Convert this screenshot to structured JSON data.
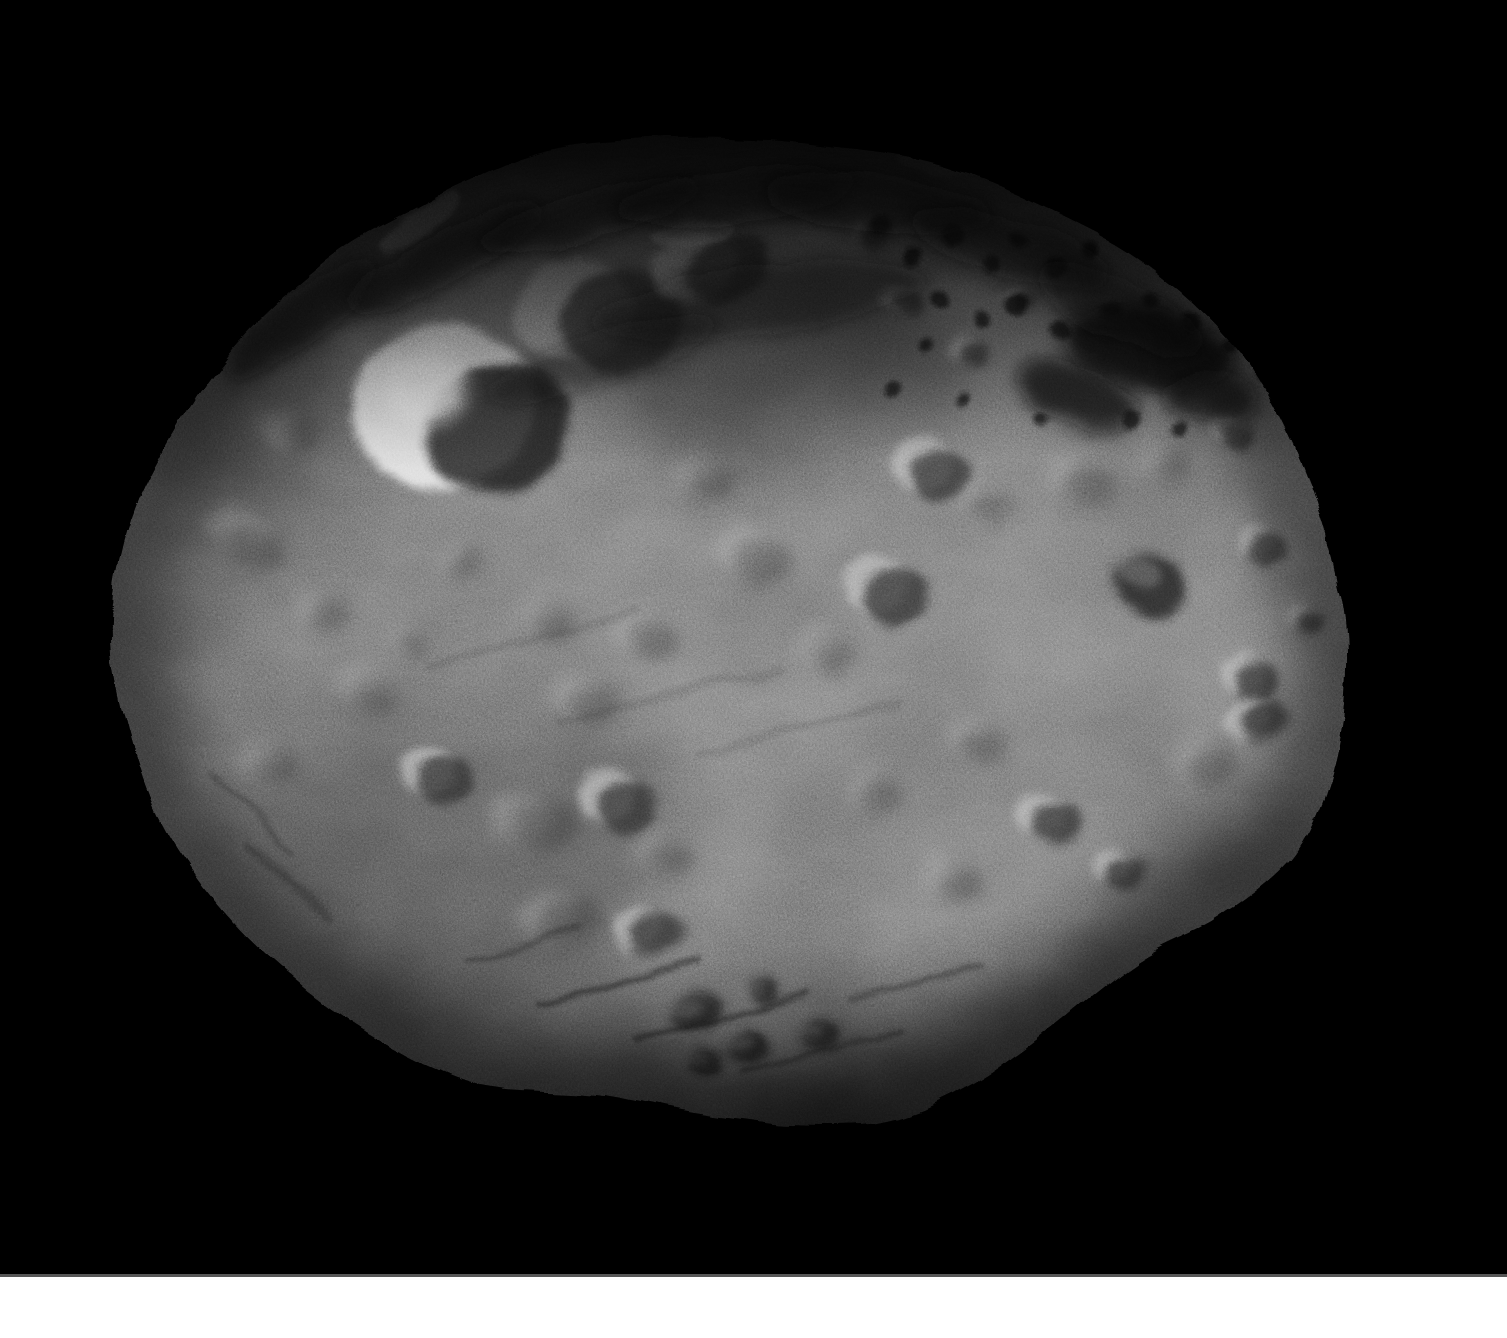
{
  "image": {
    "subject": "Full-disk grayscale photograph of asteroid Vesta against black space",
    "visible_text": "",
    "bottom_strip": "white strip across full width at bottom of frame"
  },
  "palette": {
    "space": "#000000",
    "bottom_strip": "#ffffff",
    "strip_edge": "#8f8f8f",
    "surface_core": "#9d9d9d",
    "surface_mid": "#8e8e8e",
    "surface_dim": "#7c7c7c",
    "surface_edge": "#6e6e6e",
    "crater_highlight": "#c6c6c6",
    "crater_shadow": "#2e2e2e",
    "bright_crater_fill": "#e6e6e6",
    "bright_hotspot": "#f2f2f2",
    "dark_bowl": "#1a1a1a",
    "north_shadow": "#000000",
    "streak_dark": "#0e0e0e",
    "speckle_dark": "#101010",
    "shade_dark": "#000000",
    "shade_light": "#d2d2d2",
    "groove_dark": "#222222",
    "bright_arc": "#dcdcdc"
  },
  "scene": {
    "canvas": {
      "width": 1507,
      "height": 1338,
      "strip_top": 1277,
      "strip_edge_height": 3
    },
    "body_box": {
      "x": 100,
      "y": 118,
      "width": 1260,
      "height": 1030
    },
    "top_shadow_rect": {
      "x": 90,
      "y": 118,
      "width": 1320,
      "height": 345
    },
    "bottom_shadow_rect": {
      "x": 140,
      "y": 915,
      "width": 1270,
      "height": 230
    },
    "outline": [
      [
        540,
        152
      ],
      [
        630,
        140
      ],
      [
        730,
        138
      ],
      [
        830,
        146
      ],
      [
        935,
        163
      ],
      [
        1040,
        205
      ],
      [
        1145,
        262
      ],
      [
        1235,
        345
      ],
      [
        1295,
        448
      ],
      [
        1332,
        556
      ],
      [
        1347,
        652
      ],
      [
        1336,
        758
      ],
      [
        1297,
        852
      ],
      [
        1222,
        916
      ],
      [
        1135,
        962
      ],
      [
        1046,
        1032
      ],
      [
        972,
        1084
      ],
      [
        888,
        1120
      ],
      [
        792,
        1124
      ],
      [
        692,
        1112
      ],
      [
        596,
        1094
      ],
      [
        498,
        1088
      ],
      [
        432,
        1068
      ],
      [
        330,
        1008
      ],
      [
        232,
        922
      ],
      [
        160,
        820
      ],
      [
        122,
        706
      ],
      [
        112,
        618
      ],
      [
        130,
        522
      ],
      [
        174,
        432
      ],
      [
        238,
        342
      ],
      [
        332,
        256
      ],
      [
        410,
        210
      ],
      [
        465,
        182
      ]
    ],
    "craters": [
      {
        "x": 462,
        "y": 412,
        "r": 100,
        "e": 0.9,
        "rot": -12,
        "t": "bright"
      },
      {
        "x": 598,
        "y": 316,
        "r": 76,
        "e": 0.88,
        "rot": -18,
        "t": "bowl"
      },
      {
        "x": 713,
        "y": 268,
        "r": 54,
        "e": 0.78,
        "rot": -22,
        "t": "bowl"
      },
      {
        "x": 290,
        "y": 432,
        "r": 26,
        "e": 0.8,
        "rot": -30,
        "t": "soft"
      },
      {
        "x": 248,
        "y": 538,
        "r": 42,
        "e": 0.6,
        "rot": 28,
        "t": "soft"
      },
      {
        "x": 322,
        "y": 612,
        "r": 26,
        "e": 0.8,
        "rot": 0,
        "t": "soft"
      },
      {
        "x": 366,
        "y": 692,
        "r": 30,
        "e": 0.75,
        "rot": 15,
        "t": "soft"
      },
      {
        "x": 270,
        "y": 762,
        "r": 26,
        "e": 0.8,
        "rot": 0,
        "t": "soft"
      },
      {
        "x": 436,
        "y": 776,
        "r": 34,
        "e": 0.85,
        "rot": 0,
        "t": "bowl"
      },
      {
        "x": 532,
        "y": 822,
        "r": 38,
        "e": 0.8,
        "rot": -10,
        "t": "soft"
      },
      {
        "x": 616,
        "y": 802,
        "r": 40,
        "e": 0.85,
        "rot": 0,
        "t": "bowl"
      },
      {
        "x": 586,
        "y": 700,
        "r": 30,
        "e": 0.85,
        "rot": 0,
        "t": "soft"
      },
      {
        "x": 662,
        "y": 856,
        "r": 28,
        "e": 0.8,
        "rot": 0,
        "t": "soft"
      },
      {
        "x": 560,
        "y": 918,
        "r": 40,
        "e": 0.7,
        "rot": -15,
        "t": "soft"
      },
      {
        "x": 648,
        "y": 932,
        "r": 34,
        "e": 0.72,
        "rot": -15,
        "t": "bowl"
      },
      {
        "x": 700,
        "y": 480,
        "r": 28,
        "e": 0.85,
        "rot": 0,
        "t": "soft"
      },
      {
        "x": 756,
        "y": 558,
        "r": 34,
        "e": 0.85,
        "rot": 0,
        "t": "soft"
      },
      {
        "x": 648,
        "y": 636,
        "r": 30,
        "e": 0.85,
        "rot": 0,
        "t": "soft"
      },
      {
        "x": 545,
        "y": 620,
        "r": 26,
        "e": 0.85,
        "rot": 0,
        "t": "soft"
      },
      {
        "x": 462,
        "y": 560,
        "r": 20,
        "e": 0.85,
        "rot": 0,
        "t": "soft"
      },
      {
        "x": 410,
        "y": 640,
        "r": 18,
        "e": 0.85,
        "rot": 0,
        "t": "soft"
      },
      {
        "x": 828,
        "y": 652,
        "r": 26,
        "e": 0.85,
        "rot": 0,
        "t": "soft"
      },
      {
        "x": 885,
        "y": 590,
        "r": 40,
        "e": 0.9,
        "rot": 0,
        "t": "bowl"
      },
      {
        "x": 932,
        "y": 470,
        "r": 38,
        "e": 0.9,
        "rot": 0,
        "t": "bowl"
      },
      {
        "x": 985,
        "y": 502,
        "r": 22,
        "e": 0.85,
        "rot": 0,
        "t": "soft"
      },
      {
        "x": 1150,
        "y": 585,
        "r": 45,
        "e": 0.8,
        "rot": 20,
        "t": "dark"
      },
      {
        "x": 1262,
        "y": 545,
        "r": 22,
        "e": 0.9,
        "rot": 0,
        "t": "bowl"
      },
      {
        "x": 1250,
        "y": 680,
        "r": 28,
        "e": 0.9,
        "rot": 0,
        "t": "bowl"
      },
      {
        "x": 1205,
        "y": 760,
        "r": 30,
        "e": 0.85,
        "rot": 0,
        "t": "soft"
      },
      {
        "x": 1258,
        "y": 722,
        "r": 30,
        "e": 0.8,
        "rot": -20,
        "t": "bowl"
      },
      {
        "x": 1080,
        "y": 480,
        "r": 30,
        "e": 0.85,
        "rot": 0,
        "t": "soft"
      },
      {
        "x": 1165,
        "y": 462,
        "r": 24,
        "e": 0.8,
        "rot": 0,
        "t": "soft"
      },
      {
        "x": 1048,
        "y": 820,
        "r": 32,
        "e": 0.85,
        "rot": 0,
        "t": "bowl"
      },
      {
        "x": 1120,
        "y": 868,
        "r": 26,
        "e": 0.85,
        "rot": 0,
        "t": "bowl"
      },
      {
        "x": 952,
        "y": 878,
        "r": 28,
        "e": 0.85,
        "rot": 0,
        "t": "soft"
      },
      {
        "x": 872,
        "y": 792,
        "r": 24,
        "e": 0.85,
        "rot": 0,
        "t": "soft"
      },
      {
        "x": 976,
        "y": 742,
        "r": 28,
        "e": 0.85,
        "rot": 0,
        "t": "soft"
      },
      {
        "x": 872,
        "y": 232,
        "r": 18,
        "e": 0.85,
        "rot": 0,
        "t": "bowl"
      },
      {
        "x": 902,
        "y": 300,
        "r": 20,
        "e": 0.85,
        "rot": 0,
        "t": "bowl"
      },
      {
        "x": 968,
        "y": 352,
        "r": 18,
        "e": 0.85,
        "rot": 0,
        "t": "bowl"
      },
      {
        "x": 1018,
        "y": 300,
        "r": 16,
        "e": 0.85,
        "rot": 0,
        "t": "bowl"
      },
      {
        "x": 1232,
        "y": 432,
        "r": 20,
        "e": 0.85,
        "rot": 0,
        "t": "bowl"
      },
      {
        "x": 1305,
        "y": 620,
        "r": 18,
        "e": 0.85,
        "rot": 0,
        "t": "bowl"
      },
      {
        "x": 698,
        "y": 1012,
        "r": 28,
        "e": 0.8,
        "rot": -10,
        "t": "dark"
      },
      {
        "x": 748,
        "y": 1046,
        "r": 26,
        "e": 0.8,
        "rot": -10,
        "t": "dark"
      },
      {
        "x": 705,
        "y": 1062,
        "r": 20,
        "e": 0.8,
        "rot": 0,
        "t": "dark"
      },
      {
        "x": 765,
        "y": 992,
        "r": 18,
        "e": 0.8,
        "rot": 0,
        "t": "dark"
      },
      {
        "x": 820,
        "y": 1035,
        "r": 22,
        "e": 0.8,
        "rot": -10,
        "t": "dark"
      }
    ],
    "shades": [
      {
        "kind": "dark",
        "x": 790,
        "y": 380,
        "rx": 170,
        "ry": 110,
        "rot": -10,
        "o": 0.26
      },
      {
        "kind": "dark",
        "x": 430,
        "y": 880,
        "rx": 260,
        "ry": 150,
        "rot": -20,
        "o": 0.15
      },
      {
        "kind": "dark",
        "x": 250,
        "y": 430,
        "rx": 120,
        "ry": 90,
        "rot": -30,
        "o": 0.22
      },
      {
        "kind": "dark",
        "x": 1190,
        "y": 905,
        "rx": 150,
        "ry": 70,
        "rot": -35,
        "o": 0.2
      },
      {
        "kind": "dark",
        "x": 950,
        "y": 1060,
        "rx": 220,
        "ry": 70,
        "rot": -18,
        "o": 0.25
      },
      {
        "kind": "light",
        "x": 905,
        "y": 450,
        "rx": 130,
        "ry": 60,
        "rot": 10,
        "o": 0.14
      },
      {
        "kind": "light",
        "x": 990,
        "y": 935,
        "rx": 150,
        "ry": 85,
        "rot": -18,
        "o": 0.2
      },
      {
        "kind": "light",
        "x": 1260,
        "y": 620,
        "rx": 90,
        "ry": 160,
        "rot": 0,
        "o": 0.12
      },
      {
        "kind": "light",
        "x": 690,
        "y": 600,
        "rx": 260,
        "ry": 180,
        "rot": 0,
        "o": 0.07
      },
      {
        "kind": "light",
        "x": 1130,
        "y": 700,
        "rx": 170,
        "ry": 120,
        "rot": 0,
        "o": 0.1
      }
    ],
    "streaks": [
      {
        "x": 300,
        "y": 318,
        "rx": 95,
        "ry": 26,
        "rot": -35,
        "o": 0.6
      },
      {
        "x": 445,
        "y": 258,
        "rx": 110,
        "ry": 26,
        "rot": -28,
        "o": 0.65
      },
      {
        "x": 590,
        "y": 215,
        "rx": 115,
        "ry": 24,
        "rot": -15,
        "o": 0.65
      },
      {
        "x": 735,
        "y": 196,
        "rx": 120,
        "ry": 26,
        "rot": -6,
        "o": 0.6
      },
      {
        "x": 880,
        "y": 205,
        "rx": 115,
        "ry": 28,
        "rot": 6,
        "o": 0.6
      },
      {
        "x": 1010,
        "y": 248,
        "rx": 105,
        "ry": 30,
        "rot": 16,
        "o": 0.55
      },
      {
        "x": 1120,
        "y": 310,
        "rx": 90,
        "ry": 30,
        "rot": 24,
        "o": 0.5
      },
      {
        "x": 760,
        "y": 300,
        "rx": 170,
        "ry": 34,
        "rot": -8,
        "o": 0.45
      },
      {
        "x": 600,
        "y": 360,
        "rx": 120,
        "ry": 26,
        "rot": -18,
        "o": 0.4
      }
    ],
    "dark_patches": [
      {
        "x": 1148,
        "y": 348,
        "rx": 88,
        "ry": 40,
        "rot": 10,
        "o": 0.85
      },
      {
        "x": 1078,
        "y": 396,
        "rx": 62,
        "ry": 30,
        "rot": 18,
        "o": 0.75
      },
      {
        "x": 1210,
        "y": 398,
        "rx": 48,
        "ry": 24,
        "rot": 4,
        "o": 0.7
      }
    ],
    "speckles": [
      [
        880,
        225,
        10
      ],
      [
        915,
        255,
        8
      ],
      [
        950,
        235,
        12
      ],
      [
        990,
        265,
        9
      ],
      [
        1020,
        240,
        8
      ],
      [
        1055,
        270,
        11
      ],
      [
        1090,
        250,
        9
      ],
      [
        940,
        300,
        10
      ],
      [
        980,
        320,
        8
      ],
      [
        1015,
        305,
        12
      ],
      [
        1060,
        330,
        10
      ],
      [
        1110,
        310,
        9
      ],
      [
        1150,
        300,
        8
      ],
      [
        1190,
        320,
        10
      ],
      [
        1230,
        345,
        9
      ],
      [
        1265,
        375,
        8
      ],
      [
        1130,
        420,
        9
      ],
      [
        1180,
        430,
        8
      ],
      [
        1040,
        420,
        7
      ],
      [
        925,
        345,
        7
      ],
      [
        895,
        390,
        8
      ],
      [
        960,
        400,
        7
      ]
    ],
    "grooves": [
      {
        "x1": 540,
        "y1": 1005,
        "x2": 700,
        "y2": 958,
        "w": 6,
        "o": 0.5
      },
      {
        "x1": 640,
        "y1": 1042,
        "x2": 810,
        "y2": 995,
        "w": 6,
        "o": 0.5
      },
      {
        "x1": 742,
        "y1": 1072,
        "x2": 900,
        "y2": 1030,
        "w": 5,
        "o": 0.45
      },
      {
        "x1": 470,
        "y1": 962,
        "x2": 580,
        "y2": 930,
        "w": 5,
        "o": 0.4
      },
      {
        "x1": 850,
        "y1": 1000,
        "x2": 980,
        "y2": 965,
        "w": 5,
        "o": 0.4
      },
      {
        "x1": 250,
        "y1": 845,
        "x2": 330,
        "y2": 918,
        "w": 6,
        "o": 0.35
      },
      {
        "x1": 215,
        "y1": 770,
        "x2": 290,
        "y2": 855,
        "w": 5,
        "o": 0.3
      },
      {
        "x1": 430,
        "y1": 665,
        "x2": 640,
        "y2": 612,
        "w": 8,
        "o": 0.12
      },
      {
        "x1": 560,
        "y1": 722,
        "x2": 780,
        "y2": 668,
        "w": 8,
        "o": 0.12
      },
      {
        "x1": 700,
        "y1": 755,
        "x2": 900,
        "y2": 705,
        "w": 8,
        "o": 0.12
      }
    ],
    "bright_arcs": [
      {
        "x": 420,
        "y": 222,
        "rx": 48,
        "ry": 13,
        "rot": -35,
        "o": 0.75
      },
      {
        "x": 692,
        "y": 232,
        "rx": 40,
        "ry": 14,
        "rot": -10,
        "o": 0.45
      },
      {
        "x": 955,
        "y": 162,
        "rx": 60,
        "ry": 12,
        "rot": 3,
        "o": 0.35
      }
    ]
  }
}
